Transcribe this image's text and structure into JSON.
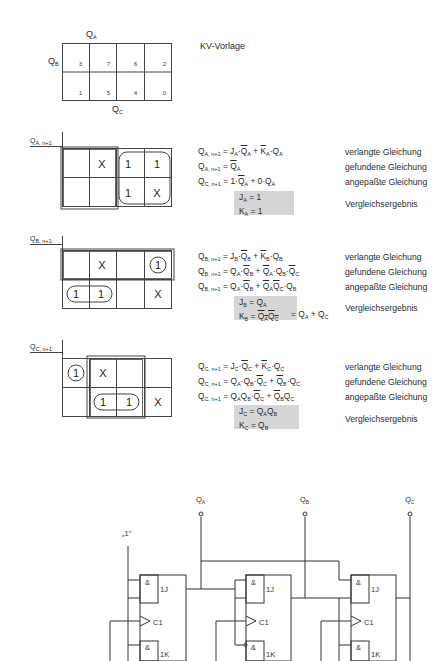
{
  "template": {
    "title": "KV-Vorlage",
    "col_label": "QA",
    "row_label": "QB",
    "bottom_label": "QC",
    "cells_top": [
      "3",
      "7",
      "6",
      "2"
    ],
    "cells_bottom": [
      "1",
      "5",
      "4",
      "0"
    ]
  },
  "maps": [
    {
      "label": "QA, n+1:",
      "cells_top": [
        "",
        "X",
        "1",
        "1"
      ],
      "cells_bottom": [
        "",
        "",
        "1",
        "X"
      ],
      "equations": [
        {
          "text": "QA,n+1 = JA·Q̄A + K̄A·QA",
          "desc": "verlangte Gleichung"
        },
        {
          "text": "QA,n+1 = Q̄A",
          "desc": "gefundene Gleichung"
        },
        {
          "text": "QC,n+1 = 1·Q̄A + 0·QA",
          "desc": "angepaßte Gleichung"
        }
      ],
      "result": [
        "JA = 1",
        "KA = 1"
      ],
      "result_desc": "Vergleichsergebnis"
    },
    {
      "label": "QB, n+1:",
      "cells_top": [
        "",
        "X",
        "",
        "1"
      ],
      "cells_bottom": [
        "1",
        "1",
        "",
        "X"
      ],
      "equations": [
        {
          "text": "QB,n+1 = JB·Q̄B + K̄B·QB",
          "desc": "verlangte Gleichung"
        },
        {
          "text": "QB,n+1 = QA·Q̄B + Q̄A·QB·Q̄C",
          "desc": "gefundene Gleichung"
        },
        {
          "text": "QB,n+1 = QA·Q̄B + Q̄AQ̄C·QB",
          "desc": "angepaßte Gleichung"
        }
      ],
      "result": [
        "JB = QA",
        "KB = Q̄AQ̄C (overlined) = QA + QC"
      ],
      "result_desc": "Vergleichsergebnis"
    },
    {
      "label": "QC, n+1:",
      "cells_top": [
        "1",
        "X",
        "",
        ""
      ],
      "cells_bottom": [
        "",
        "1",
        "1",
        "X"
      ],
      "equations": [
        {
          "text": "QC,n+1 = JC·Q̄C + K̄C·QC",
          "desc": "verlangte Gleichung"
        },
        {
          "text": "QC,n+1 = QA·QB·Q̄C + Q̄B·QC",
          "desc": "gefundene Gleichung"
        },
        {
          "text": "QC,n+1 = QAQB·Q̄C + Q̄BQC",
          "desc": "angepaßte Gleichung"
        }
      ],
      "result": [
        "JC = QAQB",
        "KC = QB"
      ],
      "result_desc": "Vergleichsergebnis"
    }
  ],
  "circuit": {
    "const_label": "„1\"",
    "outputs": [
      "QA",
      "QB",
      "QC"
    ],
    "ff_labels": {
      "and": "&",
      "j": "1J",
      "clk": "C1",
      "k": "1K"
    }
  }
}
